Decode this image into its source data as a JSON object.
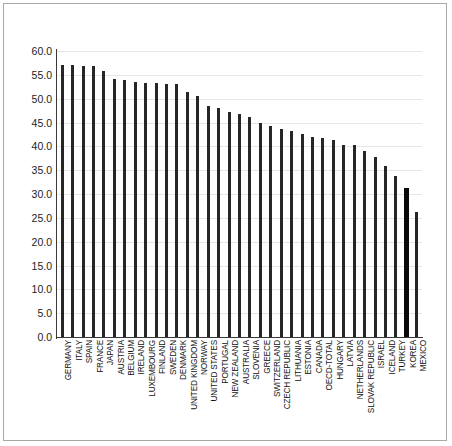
{
  "chart_data": {
    "type": "bar",
    "title": "",
    "subtitle": "",
    "xlabel": "",
    "ylabel": "",
    "ylim": [
      0.0,
      60.0
    ],
    "ytick_step": 5.0,
    "yticks": [
      "60.0",
      "55.0",
      "50.0",
      "45.0",
      "40.0",
      "35.0",
      "30.0",
      "25.0",
      "20.0",
      "15.0",
      "10.0",
      "5.0",
      "0.0"
    ],
    "grid": true,
    "grid_axis": "y",
    "legend": null,
    "legend_position": "none",
    "bar_color": "#262626",
    "highlight_color": "#0a0a0a",
    "highlight_category": "KOREA",
    "categories": [
      "GERMANY",
      "ITALY",
      "SPAIN",
      "FRANCE",
      "JAPAN",
      "AUSTRIA",
      "BELGIUM",
      "IRELAND",
      "LUXEMBOURG",
      "FINLAND",
      "SWEDEN",
      "DENMARK",
      "UNITED KINGDOM",
      "NORWAY",
      "UNITED STATES",
      "PORTUGAL",
      "NEW ZEALAND",
      "AUSTRALIA",
      "SLOVENIA",
      "GREECE",
      "SWITZERLAND",
      "CZECH REPUBLIC",
      "LITHUANIA",
      "ESTONIA",
      "CANADA",
      "OECD-TOTAL",
      "HUNGARY",
      "LATVIA",
      "NETHERLANDS",
      "SLOVAK REPUBLIC",
      "ISRAEL",
      "ICELAND",
      "TURKEY",
      "KOREA",
      "MEXICO"
    ],
    "values": [
      57.1,
      57.0,
      56.9,
      56.8,
      55.8,
      54.2,
      53.9,
      53.6,
      53.3,
      53.2,
      53.1,
      53.0,
      51.3,
      50.6,
      48.5,
      48.0,
      47.3,
      46.7,
      46.1,
      45.0,
      44.2,
      43.6,
      43.2,
      42.6,
      42.0,
      41.8,
      41.3,
      40.3,
      40.2,
      39.0,
      37.7,
      35.8,
      33.7,
      31.2,
      26.2
    ]
  }
}
